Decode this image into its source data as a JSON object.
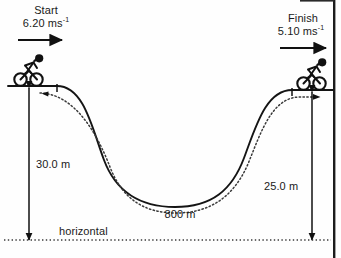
{
  "diagram": {
    "background_color": "#fefefe",
    "line_color": "#111111",
    "start": {
      "label": "Start",
      "speed": "6.20 ms",
      "speed_exponent": "-1",
      "arrow_direction": "right"
    },
    "finish": {
      "label": "Finish",
      "speed": "5.10 ms",
      "speed_exponent": "-1",
      "arrow_direction": "right"
    },
    "measurements": {
      "height_left": "30.0 m",
      "height_right": "25.0 m",
      "horizontal_span": "800 m"
    },
    "baseline_label": "horizontal",
    "icons": {
      "cyclist_left": "cyclist-icon",
      "cyclist_right": "cyclist-icon",
      "arrow_start": "arrow-right-icon",
      "arrow_finish": "arrow-right-icon",
      "dimension_left": "double-arrow-vertical-icon",
      "dimension_right": "double-arrow-vertical-icon",
      "path_solid": "terrain-profile-line",
      "path_dotted": "cyclist-trajectory-dotted"
    }
  }
}
